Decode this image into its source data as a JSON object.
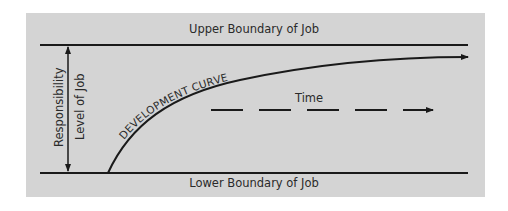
{
  "diagram": {
    "upper_boundary_label": "Upper Boundary of Job",
    "lower_boundary_label": "Lower Boundary of Job",
    "curve_label": "DEVELOPMENT CURVE",
    "time_label": "Time",
    "axis_label_outer": "Responsibility",
    "axis_label_inner": "Level of Job",
    "colors": {
      "panel_background": "#d4d4d4",
      "line": "#1a1a1a",
      "text": "#2a2a2a"
    }
  }
}
